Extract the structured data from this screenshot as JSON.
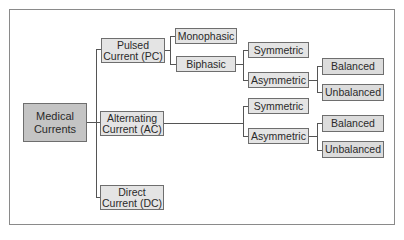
{
  "diagram": {
    "root": {
      "line1": "Medical",
      "line2": "Currents"
    },
    "level1": [
      {
        "line1": "Pulsed",
        "line2": "Current (PC)"
      },
      {
        "line1": "Alternating",
        "line2": "Current (AC)"
      },
      {
        "line1": "Direct",
        "line2": "Current (DC)"
      }
    ],
    "pc_children": [
      "Monophasic",
      "Biphasic"
    ],
    "biphasic_children": [
      "Symmetric",
      "Asymmetric"
    ],
    "pc_asym_children": [
      "Balanced",
      "Unbalanced"
    ],
    "ac_children": [
      "Symmetric",
      "Asymmetric"
    ],
    "ac_asym_children": [
      "Balanced",
      "Unbalanced"
    ]
  }
}
